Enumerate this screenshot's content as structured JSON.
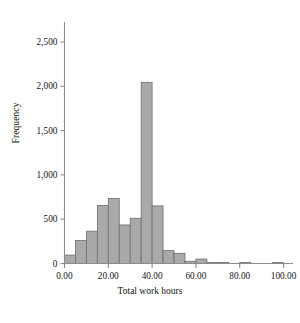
{
  "figure": {
    "background": "#ffffff",
    "caption_fragment": ""
  },
  "axes": {
    "x_label": "Total work hours",
    "y_label": "Frequency",
    "x_ticks": [
      "0.00",
      "20.00",
      "40.00",
      "60.00",
      "80.00",
      "100.00"
    ],
    "x_tick_values": [
      0,
      20,
      40,
      60,
      80,
      100
    ],
    "y_ticks": [
      "0",
      "500",
      "1,000",
      "1,500",
      "2,000",
      "2,500"
    ],
    "y_tick_values": [
      0,
      500,
      1000,
      1500,
      2000,
      2500
    ],
    "axis_color": "#8c8c8c",
    "text_color": "#141414"
  },
  "style": {
    "bar_fill": "#a9a9a9",
    "bar_stroke": "#6e6e6e"
  },
  "chart_data": {
    "type": "bar",
    "title": "",
    "subtitle": "",
    "xlabel": "Total work hours",
    "ylabel": "Frequency",
    "xlim": [
      0,
      102.5
    ],
    "ylim": [
      0,
      2600
    ],
    "grid": false,
    "legend": null,
    "bin_width": 5,
    "bin_starts": [
      0,
      5,
      10,
      15,
      20,
      25,
      30,
      35,
      40,
      45,
      50,
      55,
      60,
      65,
      70,
      75,
      80,
      85,
      90,
      95
    ],
    "categories": [
      "0-5",
      "5-10",
      "10-15",
      "15-20",
      "20-25",
      "25-30",
      "30-35",
      "35-40",
      "40-45",
      "45-50",
      "50-55",
      "55-60",
      "60-65",
      "65-70",
      "70-75",
      "75-80",
      "80-85",
      "85-90",
      "90-95",
      "95-100"
    ],
    "values": [
      95,
      260,
      365,
      655,
      735,
      435,
      510,
      2045,
      650,
      145,
      115,
      25,
      50,
      8,
      10,
      0,
      5,
      0,
      0,
      5
    ],
    "annotations": []
  }
}
